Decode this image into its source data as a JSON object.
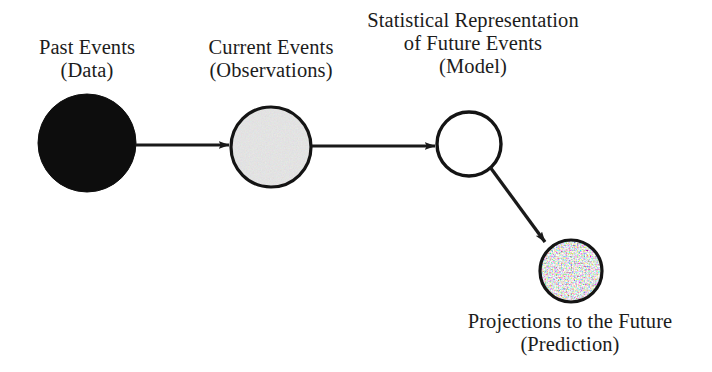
{
  "diagram": {
    "background_color": "#ffffff",
    "stroke_color": "#1a1a1a",
    "nodes": [
      {
        "id": "past-events",
        "label_line1": "Past Events",
        "label_line2": "(Data)",
        "fill_style": "solid-black",
        "fill_color": "#0d0d0d",
        "cx": 87,
        "cy": 143,
        "r": 49
      },
      {
        "id": "current-events",
        "label_line1": "Current Events",
        "label_line2": "(Observations)",
        "fill_style": "light-gray-noise",
        "fill_color": "#bdbdbd",
        "cx": 271,
        "cy": 147,
        "r": 40
      },
      {
        "id": "model",
        "label_line1": "Statistical Representation",
        "label_line2": "of Future Events",
        "label_line3": "(Model)",
        "fill_style": "white",
        "fill_color": "#ffffff",
        "cx": 469,
        "cy": 144,
        "r": 32
      },
      {
        "id": "projection",
        "label_line1": "Projections to the Future",
        "label_line2": "(Prediction)",
        "fill_style": "speckled",
        "fill_color": "#d8d8d8",
        "cx": 571,
        "cy": 271,
        "r": 31
      }
    ],
    "arrows": [
      {
        "id": "past-to-current",
        "from": "past-events",
        "to": "current-events",
        "x1": 136,
        "y1": 145,
        "x2": 229,
        "y2": 145
      },
      {
        "id": "current-to-model",
        "from": "current-events",
        "to": "model",
        "x1": 312,
        "y1": 146,
        "x2": 435,
        "y2": 146
      },
      {
        "id": "model-to-projection",
        "from": "model",
        "to": "projection",
        "x1": 490,
        "y1": 167,
        "x2": 545,
        "y2": 242
      }
    ]
  }
}
